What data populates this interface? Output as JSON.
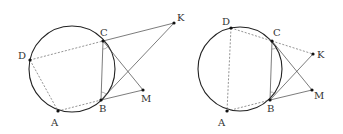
{
  "figures": [
    {
      "id": "left",
      "circle": {
        "cx": 72,
        "cy": 69,
        "r": 43
      },
      "points": {
        "D": {
          "x": 30,
          "y": 60,
          "label": "D",
          "lx": 18,
          "ly": 59
        },
        "C": {
          "x": 103,
          "y": 41,
          "label": "C",
          "lx": 100,
          "ly": 36
        },
        "B": {
          "x": 101,
          "y": 100,
          "label": "B",
          "lx": 99,
          "ly": 112
        },
        "A": {
          "x": 58,
          "y": 111,
          "label": "A",
          "lx": 51,
          "ly": 126
        },
        "K": {
          "x": 174,
          "y": 23,
          "label": "K",
          "lx": 177,
          "ly": 21
        },
        "M": {
          "x": 143,
          "y": 90,
          "label": "M",
          "lx": 141,
          "ly": 102
        }
      }
    },
    {
      "id": "right",
      "circle": {
        "cx": 240,
        "cy": 69,
        "r": 42
      },
      "points": {
        "D": {
          "x": 231,
          "y": 28,
          "label": "D",
          "lx": 222,
          "ly": 25
        },
        "C": {
          "x": 272,
          "y": 41,
          "label": "C",
          "lx": 273,
          "ly": 36
        },
        "B": {
          "x": 270,
          "y": 100,
          "label": "B",
          "lx": 267,
          "ly": 112
        },
        "A": {
          "x": 227,
          "y": 111,
          "label": "A",
          "lx": 218,
          "ly": 126
        },
        "K": {
          "x": 313,
          "y": 54,
          "label": "K",
          "lx": 317,
          "ly": 58
        },
        "M": {
          "x": 312,
          "y": 90,
          "label": "M",
          "lx": 314,
          "ly": 99
        }
      }
    }
  ]
}
